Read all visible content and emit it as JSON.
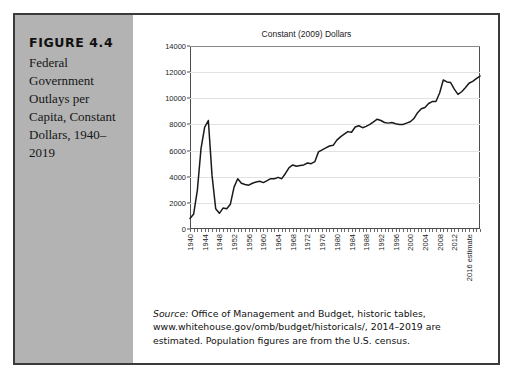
{
  "figure": {
    "label": "FIGURE 4.4",
    "caption": "Federal Government Outlays per Capita, Constant Dollars, 1940–2019",
    "source_label": "Source:",
    "source_text": " Office of Management and Budget, historic tables, www.whitehouse.gov/omb/budget/historicals/, 2014–2019 are estimated. Population figures are from the U.S. census.",
    "panel_color": "#b3b3b3",
    "border_color": "#3a3a3a"
  },
  "chart_data": {
    "type": "line",
    "title": "Constant (2009) Dollars",
    "xlabel": "",
    "ylabel": "",
    "ylim": [
      0,
      14000
    ],
    "ytick_values": [
      0,
      2000,
      4000,
      6000,
      8000,
      10000,
      12000,
      14000
    ],
    "ytick_labels": [
      "0",
      "2000",
      "4000",
      "6000",
      "8000",
      "10000",
      "12000",
      "14000"
    ],
    "xlim": [
      1940,
      2019
    ],
    "xtick_labels": [
      "1940",
      "1944",
      "1948",
      "1952",
      "1956",
      "1960",
      "1964",
      "1968",
      "1972",
      "1976",
      "1980",
      "1984",
      "1988",
      "1992",
      "1996",
      "2000",
      "2004",
      "2008",
      "2012",
      "2016 estimate"
    ],
    "xtick_years": [
      1940,
      1944,
      1948,
      1952,
      1956,
      1960,
      1964,
      1968,
      1972,
      1976,
      1980,
      1984,
      1988,
      1992,
      1996,
      2000,
      2004,
      2008,
      2012,
      2016
    ],
    "grid": "horizontal",
    "legend": "none",
    "line_color": "#1a1a1a",
    "x": [
      1940,
      1941,
      1942,
      1943,
      1944,
      1945,
      1946,
      1947,
      1948,
      1949,
      1950,
      1951,
      1952,
      1953,
      1954,
      1955,
      1956,
      1957,
      1958,
      1959,
      1960,
      1961,
      1962,
      1963,
      1964,
      1965,
      1966,
      1967,
      1968,
      1969,
      1970,
      1971,
      1972,
      1973,
      1974,
      1975,
      1976,
      1977,
      1978,
      1979,
      1980,
      1981,
      1982,
      1983,
      1984,
      1985,
      1986,
      1987,
      1988,
      1989,
      1990,
      1991,
      1992,
      1993,
      1994,
      1995,
      1996,
      1997,
      1998,
      1999,
      2000,
      2001,
      2002,
      2003,
      2004,
      2005,
      2006,
      2007,
      2008,
      2009,
      2010,
      2011,
      2012,
      2013,
      2014,
      2015,
      2016,
      2017,
      2018,
      2019
    ],
    "values": [
      800,
      1150,
      2950,
      6150,
      7800,
      8300,
      4100,
      1550,
      1200,
      1600,
      1550,
      1900,
      3200,
      3850,
      3500,
      3400,
      3350,
      3500,
      3600,
      3650,
      3550,
      3700,
      3850,
      3850,
      3950,
      3850,
      4250,
      4700,
      4900,
      4800,
      4850,
      4900,
      5050,
      5000,
      5150,
      5900,
      6050,
      6200,
      6350,
      6400,
      6800,
      7050,
      7250,
      7450,
      7400,
      7800,
      7900,
      7750,
      7850,
      8000,
      8200,
      8400,
      8300,
      8150,
      8100,
      8150,
      8050,
      8000,
      8000,
      8100,
      8200,
      8450,
      8900,
      9200,
      9300,
      9600,
      9750,
      9750,
      10400,
      11400,
      11250,
      11200,
      10700,
      10300,
      10500,
      10800,
      11150,
      11300,
      11500,
      11700
    ]
  }
}
